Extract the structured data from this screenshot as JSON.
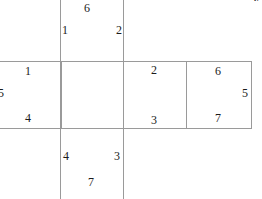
{
  "figure": {
    "kind": "cube-net-diagram",
    "stroke_color": "#9a9a9a",
    "text_color": "#1b1b1b",
    "background": "#ffffff",
    "corner_glyph": "V"
  },
  "faces": {
    "top": {
      "name": "top-face",
      "labels": {
        "top_center": "6",
        "bottom_left": "1",
        "bottom_right": "2"
      }
    },
    "left": {
      "name": "left-face",
      "labels": {
        "top_right": "1",
        "middle_left": "5",
        "bottom_right": "4"
      }
    },
    "center": {
      "name": "center-face",
      "labels": {}
    },
    "right": {
      "name": "right-face",
      "labels": {
        "top_center": "2",
        "bottom_center": "3"
      }
    },
    "far_right": {
      "name": "far-right-face",
      "labels": {
        "top_center": "6",
        "middle_right": "5",
        "bottom_center": "7"
      }
    },
    "bottom": {
      "name": "bottom-face",
      "labels": {
        "top_left": "4",
        "top_right": "3",
        "bottom_center": "7"
      }
    }
  },
  "vertex_labels": [
    "6",
    "1",
    "2",
    "1",
    "5",
    "4",
    "2",
    "3",
    "6",
    "5",
    "7",
    "4",
    "3",
    "7"
  ]
}
